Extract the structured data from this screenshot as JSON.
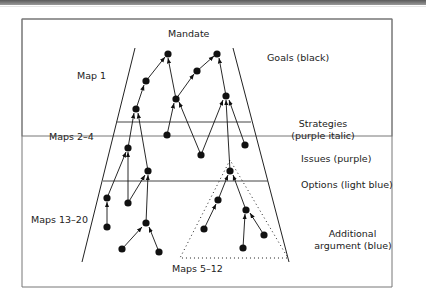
{
  "labels": {
    "mandate": "Mandate",
    "map1": "Map 1",
    "maps_2_4": "Maps 2–4",
    "maps_13_20": "Maps 13–20",
    "maps_5_12": "Maps 5–12",
    "goals": "Goals (black)",
    "strategies_line1": "Strategies",
    "strategies_line2": "(purple italic)",
    "issues": "Issues (purple)",
    "options": "Options (light blue)",
    "additional_line1": "Additional",
    "additional_line2": "argument (blue)"
  },
  "colors": {
    "node": "#111111",
    "line": "#222222",
    "frame": "#666666"
  }
}
